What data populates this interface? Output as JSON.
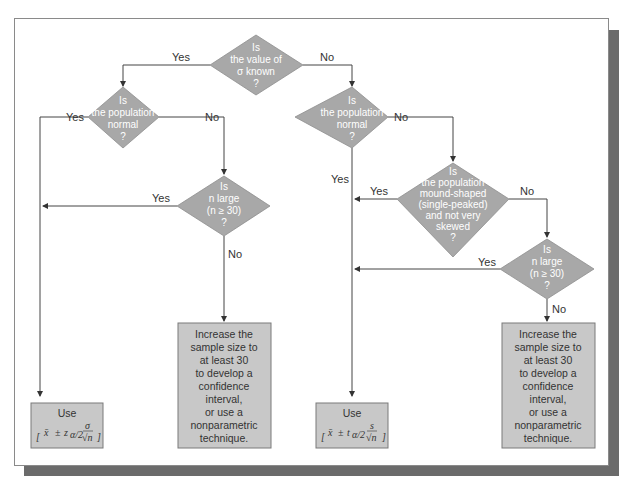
{
  "diagram": {
    "type": "flowchart",
    "colors": {
      "decision_fill": "#a8a8a8",
      "result_fill": "#c8c8c8",
      "decision_text": "#ffffff",
      "line": "#444444",
      "shadow": "#6b6b6b"
    },
    "decisions": {
      "sigma_known": {
        "lines": [
          "Is",
          "the value of",
          "σ known",
          "?"
        ]
      },
      "left_normal": {
        "lines": [
          "Is",
          "the population",
          "normal",
          "?"
        ]
      },
      "left_n_large": {
        "lines": [
          "Is",
          "n large",
          "(n ≥ 30)",
          "?"
        ]
      },
      "right_normal": {
        "lines": [
          "Is",
          "the population",
          "normal",
          "?"
        ]
      },
      "mound_shaped": {
        "lines": [
          "Is",
          "the population",
          "mound-shaped",
          "(single-peaked)",
          "and not very",
          "skewed",
          "?"
        ]
      },
      "right_n_large": {
        "lines": [
          "Is",
          "n large",
          "(n ≥ 30)",
          "?"
        ]
      }
    },
    "edge_labels": {
      "sigma_yes": "Yes",
      "sigma_no": "No",
      "left_normal_yes": "Yes",
      "left_normal_no": "No",
      "left_n_large_yes": "Yes",
      "left_n_large_no": "No",
      "right_normal_yes": "Yes",
      "right_normal_no": "No",
      "mound_yes": "Yes",
      "mound_no": "No",
      "right_n_large_yes": "Yes",
      "right_n_large_no": "No"
    },
    "results": {
      "z_interval": {
        "title": "Use",
        "formula": "[ x̄ ± zα/2 σ/√n ]",
        "parts": {
          "xbar": "x̄",
          "pm": "±",
          "stat": "z",
          "sub": "α/2",
          "num": "σ",
          "den": "√n"
        }
      },
      "t_interval": {
        "title": "Use",
        "formula": "[ x̄ ± tα/2 s/√n ]",
        "parts": {
          "xbar": "x̄",
          "pm": "±",
          "stat": "t",
          "sub": "α/2",
          "num": "s",
          "den": "√n"
        }
      },
      "increase_left": {
        "lines": [
          "Increase the",
          "sample size to",
          "at least 30",
          "to develop a",
          "confidence",
          "interval,",
          "or use a",
          "nonparametric",
          "technique."
        ]
      },
      "increase_right": {
        "lines": [
          "Increase the",
          "sample size to",
          "at least 30",
          "to develop a",
          "confidence",
          "interval,",
          "or use a",
          "nonparametric",
          "technique."
        ]
      }
    }
  }
}
